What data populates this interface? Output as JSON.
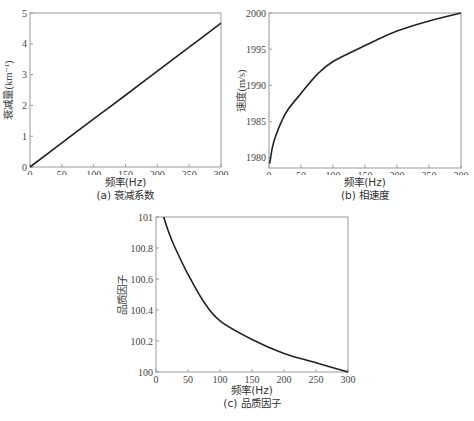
{
  "chart_data": [
    {
      "id": "a",
      "type": "line",
      "title": "(a) 衰减系数",
      "xlabel": "频率(Hz)",
      "ylabel": "衰减量(km⁻¹)",
      "xlim": [
        0,
        300
      ],
      "ylim": [
        0,
        5
      ],
      "xticks": [
        0,
        50,
        100,
        150,
        200,
        250,
        300
      ],
      "yticks": [
        0,
        1,
        2,
        3,
        4,
        5
      ],
      "grid": false,
      "series": [
        {
          "name": "衰减量",
          "x": [
            0,
            50,
            100,
            150,
            200,
            250,
            300
          ],
          "y": [
            0,
            0.78,
            1.56,
            2.33,
            3.11,
            3.89,
            4.67
          ]
        }
      ]
    },
    {
      "id": "b",
      "type": "line",
      "title": "(b) 相速度",
      "xlabel": "频率(Hz)",
      "ylabel": "速度(m/s)",
      "xlim": [
        0,
        300
      ],
      "ylim": [
        1978.6,
        2000
      ],
      "xticks": [
        0,
        50,
        100,
        150,
        200,
        250,
        300
      ],
      "yticks": [
        1980,
        1985,
        1990,
        1995,
        2000
      ],
      "grid": false,
      "series": [
        {
          "name": "相速度",
          "x": [
            1,
            5,
            10,
            20,
            30,
            50,
            75,
            100,
            150,
            200,
            250,
            300
          ],
          "y": [
            1979.2,
            1981.3,
            1982.9,
            1985.1,
            1986.7,
            1988.9,
            1991.5,
            1993.3,
            1995.5,
            1997.5,
            1998.9,
            2000.0
          ]
        }
      ]
    },
    {
      "id": "c",
      "type": "line",
      "title": "(c) 品质因子",
      "xlabel": "频率(Hz)",
      "ylabel": "品质因子",
      "xlim": [
        0,
        300
      ],
      "ylim": [
        100,
        101
      ],
      "xticks": [
        0,
        50,
        100,
        150,
        200,
        250,
        300
      ],
      "yticks": [
        100,
        100.2,
        100.4,
        100.6,
        100.8,
        101
      ],
      "grid": false,
      "series": [
        {
          "name": "品质因子",
          "x": [
            12,
            20,
            30,
            50,
            75,
            100,
            150,
            200,
            250,
            300
          ],
          "y": [
            101.0,
            100.9,
            100.8,
            100.63,
            100.45,
            100.33,
            100.21,
            100.12,
            100.06,
            100.0
          ]
        }
      ]
    }
  ]
}
